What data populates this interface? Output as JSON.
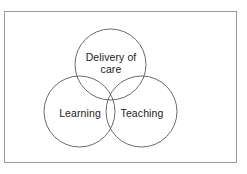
{
  "figure": {
    "type": "venn-diagram",
    "set_count": 3,
    "frame": {
      "border_color": "#9a9a9a",
      "background_color": "#ffffff"
    },
    "circle_stroke_color": "#5a5a5a",
    "text_color": "#1c1c1c",
    "circles": [
      {
        "id": "delivery-of-care",
        "label": "Delivery of care",
        "position": "top",
        "cx": 110.5,
        "cy": 64.5,
        "r": 35.5
      },
      {
        "id": "learning",
        "label": "Learning",
        "position": "bottom-left",
        "cx": 79.5,
        "cy": 111.5,
        "r": 35.5
      },
      {
        "id": "teaching",
        "label": "Teaching",
        "position": "bottom-right",
        "cx": 141.5,
        "cy": 111.5,
        "r": 35.5
      }
    ],
    "labels": {
      "delivery_of_care": "Delivery of care",
      "learning": "Learning",
      "teaching": "Teaching"
    }
  }
}
